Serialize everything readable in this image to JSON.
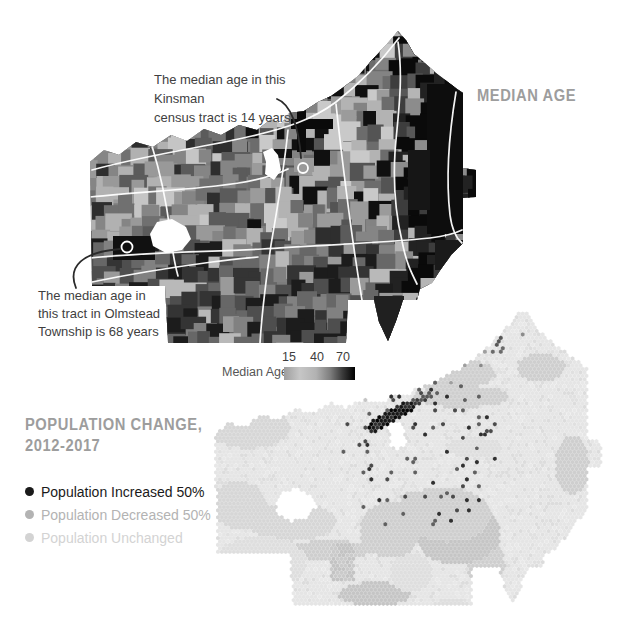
{
  "median_age_section": {
    "title": "MEDIAN AGE",
    "annotation_kinsman": {
      "line1": "The median age in this Kinsman",
      "line2": "census tract is 14 years"
    },
    "annotation_olmstead": {
      "line1": "The median age in",
      "line2": "this tract in Olmstead",
      "line3": "Township is 68 years"
    },
    "legend": {
      "label": "Median Age",
      "ticks": [
        "15",
        "40",
        "70"
      ],
      "gradient_stops": [
        [
          "#9e9e9e",
          0
        ],
        [
          "#c6c6c6",
          22
        ],
        [
          "#b2b2b2",
          45
        ],
        [
          "#7e7e7e",
          65
        ],
        [
          "#3c3c3c",
          82
        ],
        [
          "#000000",
          100
        ]
      ]
    }
  },
  "population_section": {
    "title_line1": "POPULATION CHANGE,",
    "title_line2": "2012-2017",
    "legend": [
      {
        "label": "Population Increased 50%",
        "color": "#1a1a1a"
      },
      {
        "label": "Population Decreased 50%",
        "color": "#b3b3b3"
      },
      {
        "label": "Population Unchanged",
        "color": "#d3d3d3"
      }
    ]
  },
  "chart_data": [
    {
      "type": "heatmap",
      "subtype": "choropleth_map",
      "title": "MEDIAN AGE",
      "legend_label": "Median Age",
      "scale_ticks": [
        15,
        40,
        70
      ],
      "annotations": [
        {
          "text": "The median age in this Kinsman census tract is 14 years",
          "value": 14
        },
        {
          "text": "The median age in this tract in Olmstead Township is 68 years",
          "value": 68
        }
      ]
    },
    {
      "type": "heatmap",
      "subtype": "hexbin_map",
      "title": "POPULATION CHANGE, 2012-2017",
      "categories": [
        "Population Increased 50%",
        "Population Decreased 50%",
        "Population Unchanged"
      ],
      "category_colors": [
        "#1a1a1a",
        "#b3b3b3",
        "#d3d3d3"
      ]
    }
  ],
  "map_geometry": {
    "outline": [
      [
        90,
        162
      ],
      [
        104,
        150
      ],
      [
        119,
        155
      ],
      [
        136,
        142
      ],
      [
        153,
        147
      ],
      [
        171,
        135
      ],
      [
        187,
        141
      ],
      [
        204,
        129
      ],
      [
        221,
        135
      ],
      [
        239,
        125
      ],
      [
        257,
        130
      ],
      [
        271,
        119
      ],
      [
        281,
        124
      ],
      [
        289,
        113
      ],
      [
        304,
        111
      ],
      [
        318,
        102
      ],
      [
        331,
        96
      ],
      [
        345,
        86
      ],
      [
        358,
        76
      ],
      [
        372,
        60
      ],
      [
        386,
        45
      ],
      [
        398,
        31
      ],
      [
        406,
        40
      ],
      [
        414,
        54
      ],
      [
        425,
        63
      ],
      [
        436,
        73
      ],
      [
        448,
        82
      ],
      [
        457,
        89
      ],
      [
        463,
        93
      ],
      [
        463,
        168
      ],
      [
        476,
        170
      ],
      [
        476,
        197
      ],
      [
        463,
        198
      ],
      [
        463,
        243
      ],
      [
        452,
        254
      ],
      [
        441,
        269
      ],
      [
        432,
        283
      ],
      [
        420,
        289
      ],
      [
        417,
        300
      ],
      [
        403,
        300
      ],
      [
        396,
        321
      ],
      [
        388,
        341
      ],
      [
        379,
        322
      ],
      [
        374,
        300
      ],
      [
        348,
        300
      ],
      [
        346,
        343
      ],
      [
        168,
        343
      ],
      [
        165,
        286
      ],
      [
        92,
        286
      ]
    ],
    "holes": [
      [
        [
          150,
          234
        ],
        [
          157,
          222
        ],
        [
          172,
          219
        ],
        [
          186,
          227
        ],
        [
          191,
          239
        ],
        [
          182,
          250
        ],
        [
          166,
          253
        ],
        [
          153,
          246
        ]
      ],
      [
        [
          263,
          152
        ],
        [
          272,
          148
        ],
        [
          278,
          155
        ],
        [
          281,
          170
        ],
        [
          274,
          180
        ],
        [
          265,
          174
        ],
        [
          266,
          162
        ]
      ]
    ],
    "roads": [
      "M 92 170 C 150 154 212 146 252 136 C 286 128 312 120 336 102 C 362 82 383 59 399 38",
      "M 398 42 C 404 82 397 122 395 152 C 393 186 396 216 402 241 C 406 262 411 272 417 284",
      "M 90 197 C 140 192 182 190 216 186 C 246 183 269 178 288 169",
      "M 90 258 C 150 252 210 252 262 249 C 322 245 382 243 430 238 C 446 236 456 233 462 230",
      "M 288 130 C 284 170 277 210 271 245 C 266 280 262 310 260 343",
      "M 92 282 C 140 272 182 266 212 262 C 232 259 246 258 258 257",
      "M 456 92 C 448 140 446 180 450 215 C 452 230 456 238 462 243",
      "M 336 104 C 340 142 345 182 350 220 C 354 250 358 276 362 300",
      "M 152 146 C 160 172 166 200 170 230 C 172 248 174 262 178 276"
    ],
    "overlays": [
      {
        "rect": [
          427,
          84,
          36,
          150
        ],
        "fill": "#0d0d0d"
      },
      {
        "rect": [
          408,
          150,
          22,
          60
        ],
        "fill": "#161616"
      },
      {
        "rect": [
          435,
          240,
          28,
          30
        ],
        "fill": "#1a1a1a"
      },
      {
        "rect": [
          374,
          296,
          30,
          46
        ],
        "fill": "#202020"
      },
      {
        "rect": [
          294,
          158,
          20,
          14
        ],
        "fill": "#9a9a9a"
      },
      {
        "rect": [
          297,
          108,
          9,
          44
        ],
        "fill": "#0a0a0a"
      },
      {
        "rect": [
          291,
          119,
          42,
          10
        ],
        "fill": "#0a0a0a"
      },
      {
        "rect": [
          274,
          149,
          18,
          9
        ],
        "fill": "#111111"
      },
      {
        "rect": [
          113,
          236,
          42,
          24
        ],
        "fill": "#111111"
      }
    ],
    "markers": [
      {
        "cx": 303,
        "cy": 168,
        "r": 5
      },
      {
        "cx": 127,
        "cy": 247,
        "r": 5.5
      }
    ],
    "leaders": [
      "M 277 99 C 291 104 299 128 301 158",
      "M 76 288 C 67 266 83 252 120 249"
    ],
    "tract_palettes": {
      "east": [
        [
          "#0a0a0a",
          0.42
        ],
        [
          "#222222",
          0.2
        ],
        [
          "#3d3d3d",
          0.14
        ],
        [
          "#575757",
          0.09
        ],
        [
          "#8c8c8c",
          0.08
        ],
        [
          "#b5b5b5",
          0.07
        ]
      ],
      "city": [
        [
          "#101010",
          0.17
        ],
        [
          "#c9c9c9",
          0.15
        ],
        [
          "#b3b3b3",
          0.15
        ],
        [
          "#9b9b9b",
          0.14
        ],
        [
          "#838383",
          0.13
        ],
        [
          "#545454",
          0.13
        ],
        [
          "#6c6c6c",
          0.13
        ]
      ],
      "south": [
        [
          "#1c1c1c",
          0.2
        ],
        [
          "#343434",
          0.18
        ],
        [
          "#4e4e4e",
          0.18
        ],
        [
          "#676767",
          0.16
        ],
        [
          "#818181",
          0.13
        ],
        [
          "#9a9a9a",
          0.09
        ],
        [
          "#b9b9b9",
          0.06
        ]
      ],
      "west": [
        [
          "#5b5b5b",
          0.17
        ],
        [
          "#707070",
          0.17
        ],
        [
          "#858585",
          0.16
        ],
        [
          "#999999",
          0.14
        ],
        [
          "#2e2e2e",
          0.12
        ],
        [
          "#b1b1b1",
          0.13
        ],
        [
          "#c5c5c5",
          0.11
        ]
      ]
    },
    "hex": {
      "radius": 2.3,
      "transform": {
        "dx": 125,
        "y_ref": 30,
        "y_scale": 0.955,
        "dy": 308
      },
      "base_colors": [
        "#e0e0e0",
        "#dcdcdc",
        "#e8e8e8"
      ],
      "base_default": "#e5e5e5",
      "patch_colors": [
        "#dedede",
        "#d6d6d6",
        "#cecece",
        "#c5c5c5"
      ],
      "streak": {
        "a": [
          373,
          427
        ],
        "b": [
          408,
          406
        ],
        "width": 5.5,
        "colors": [
          "#060606",
          "#181818",
          "#2f2f2f"
        ]
      },
      "streak2": {
        "a": [
          408,
          406
        ],
        "b": [
          429,
          396
        ],
        "width": 3.5,
        "colors": [
          "#3a3a3a",
          "#585858"
        ]
      },
      "scatter": {
        "center": [
          418,
          446
        ],
        "radius": 85,
        "prob": 0.055,
        "colors": [
          "#2f2f2f",
          "#4a4a4a",
          "#5f5f5f"
        ]
      },
      "corridor": {
        "a": [
          432,
          394
        ],
        "b": [
          515,
          318
        ],
        "width": 22,
        "prob": 0.05,
        "colors": [
          "#9e9e9e",
          "#8a8a8a"
        ]
      },
      "cluster": {
        "center": [
          497,
          344
        ],
        "radius": 9,
        "prob": 0.5,
        "colors": [
          "#565656",
          "#6a6a6a"
        ]
      },
      "column": {
        "rect": [
          330,
          543,
          24,
          37
        ],
        "colors": [
          "#c3c3c3",
          "#cacaca"
        ]
      }
    }
  }
}
